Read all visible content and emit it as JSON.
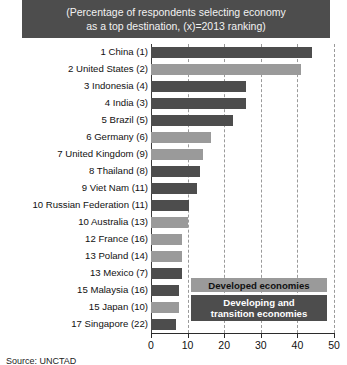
{
  "title": {
    "line1": "(Percentage of respondents selecting economy",
    "line2": "as a top destination, (x)=2013 ranking)"
  },
  "legend": {
    "developed_label": "Developed economies",
    "developing_line1": "Developing and",
    "developing_line2": "transition economies"
  },
  "source": {
    "text": "Source:  UNCTAD"
  },
  "colors": {
    "developed": "#9a9a9a",
    "developing": "#4d4d4d",
    "title_band": "#4d4d4d",
    "axis": "#2b2b2b",
    "grid": "#9a9a9a"
  },
  "chart_data": {
    "type": "bar",
    "orientation": "horizontal",
    "title": "(Percentage of respondents selecting economy as a top destination, (x)=2013 ranking)",
    "xlabel": "",
    "ylabel": "",
    "xlim": [
      0,
      50
    ],
    "xticks": [
      0,
      10,
      20,
      30,
      40,
      50
    ],
    "grid": true,
    "grid_axis": "x",
    "legend_position": "inside-lower-right",
    "categories": [
      "1 China (1)",
      "2 United States (2)",
      "3 Indonesia (4)",
      "4 India (3)",
      "5 Brazil (5)",
      "6 Germany (6)",
      "7 United Kingdom (9)",
      "8 Thailand (8)",
      "9 Viet Nam (11)",
      "10 Russian Federation (11)",
      "10 Australia (13)",
      "12 France (16)",
      "13 Poland (14)",
      "13 Mexico (7)",
      "15 Malaysia (16)",
      "15 Japan (10)",
      "17 Singapore (22)"
    ],
    "values": [
      44,
      41,
      26,
      26,
      22.5,
      16.5,
      14.3,
      13.5,
      12.6,
      10.5,
      10.2,
      8.5,
      8.5,
      8.5,
      7.7,
      7.7,
      6.9
    ],
    "groups": [
      "developing",
      "developed",
      "developing",
      "developing",
      "developing",
      "developed",
      "developed",
      "developing",
      "developing",
      "developing",
      "developed",
      "developed",
      "developed",
      "developing",
      "developing",
      "developed",
      "developing"
    ],
    "series": [
      {
        "name": "Developed economies",
        "color": "#9a9a9a"
      },
      {
        "name": "Developing and transition economies",
        "color": "#4d4d4d"
      }
    ]
  }
}
